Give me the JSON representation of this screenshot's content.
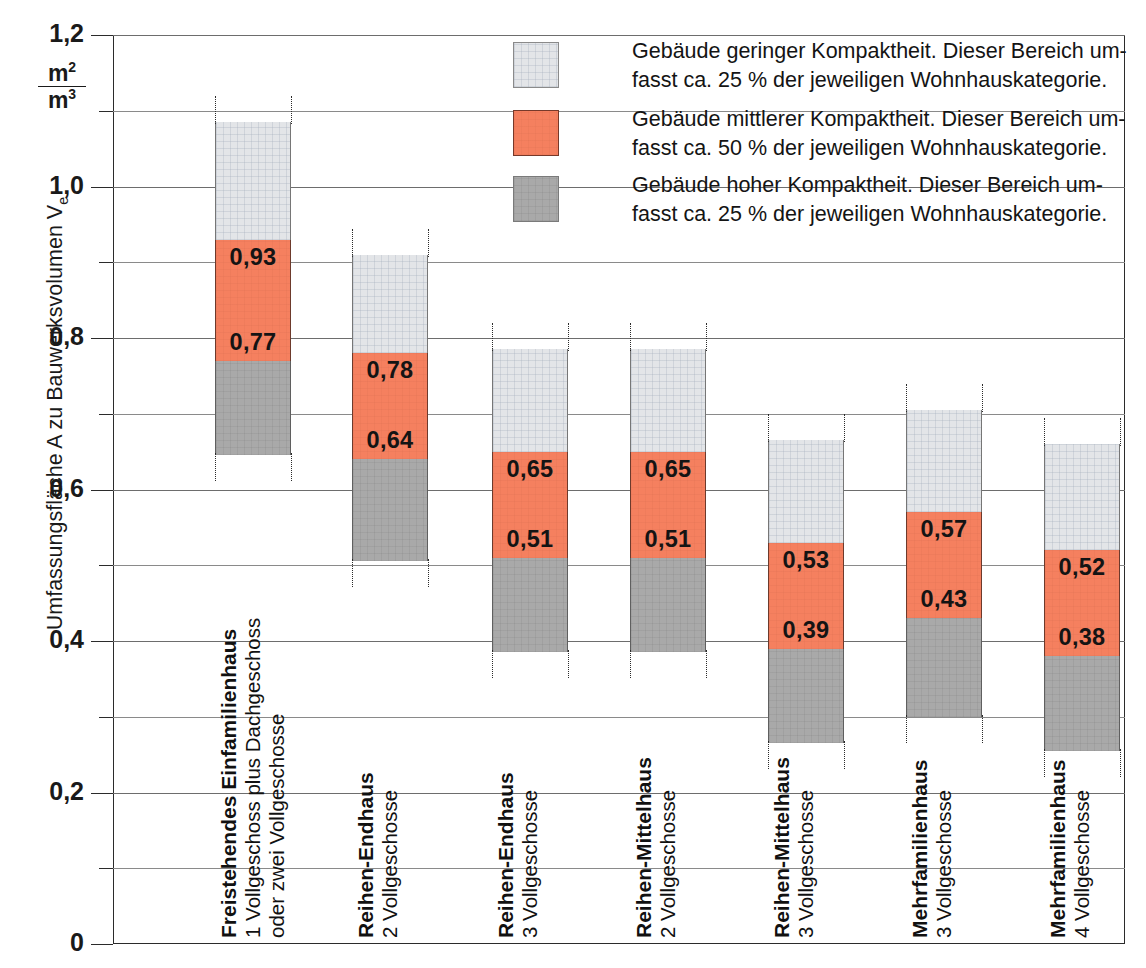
{
  "chart_data": {
    "type": "bar",
    "title": "",
    "xlabel": "",
    "ylabel": "Umfassungsfläche A zu Bauwerksvolumen V",
    "ylabel_sub": "e",
    "yunit_numerator": "m",
    "yunit_numerator_sup": "2",
    "yunit_denominator": "m",
    "yunit_denominator_sup": "3",
    "ylim": [
      0,
      1.2
    ],
    "grid": true,
    "legend_position": "top-right",
    "ytick_labels": [
      "1,2",
      "1,0",
      "0,8",
      "0,6",
      "0,4",
      "0,2",
      "0"
    ],
    "ytick_values": [
      1.2,
      1.0,
      0.8,
      0.6,
      0.4,
      0.2,
      0
    ],
    "yminor_values": [
      1.1,
      0.9,
      0.7,
      0.5,
      0.3,
      0.1
    ],
    "categories": [
      "Freistehendes Einfamilienhaus",
      "Reihen-Endhaus",
      "Reihen-Endhaus",
      "Reihen-Mittelhaus",
      "Reihen-Mittelhaus",
      "Mehrfamilienhaus",
      "Mehrfamilienhaus"
    ],
    "series": [
      {
        "name": "Gebäude hoher Kompaktheit",
        "key": "high",
        "color": "#a9a9a9"
      },
      {
        "name": "Gebäude mittlerer Kompaktheit",
        "key": "mid",
        "color": "#f5805f"
      },
      {
        "name": "Gebäude geringer Kompaktheit",
        "key": "low",
        "color": "#e3e5e8"
      }
    ],
    "bars": [
      {
        "id": "bar-1",
        "label_line1": "Freistehendes Einfamilienhaus",
        "label_line2": "1 Vollgeschoss plus Dachgeschoss",
        "label_line3": "oder zwei Vollgeschosse",
        "bottom": 0.645,
        "break_low": 0.77,
        "break_high": 0.93,
        "top": 1.085,
        "value_low_label": "0,77",
        "value_high_label": "0,93"
      },
      {
        "id": "bar-2",
        "label_line1": "Reihen-Endhaus",
        "label_line2": "2 Vollgeschosse",
        "label_line3": "",
        "bottom": 0.505,
        "break_low": 0.64,
        "break_high": 0.78,
        "top": 0.91,
        "value_low_label": "0,64",
        "value_high_label": "0,78"
      },
      {
        "id": "bar-3",
        "label_line1": "Reihen-Endhaus",
        "label_line2": "3 Vollgeschosse",
        "label_line3": "",
        "bottom": 0.385,
        "break_low": 0.51,
        "break_high": 0.65,
        "top": 0.785,
        "value_low_label": "0,51",
        "value_high_label": "0,65"
      },
      {
        "id": "bar-4",
        "label_line1": "Reihen-Mittelhaus",
        "label_line2": "2 Vollgeschosse",
        "label_line3": "",
        "bottom": 0.385,
        "break_low": 0.51,
        "break_high": 0.65,
        "top": 0.785,
        "value_low_label": "0,51",
        "value_high_label": "0,65"
      },
      {
        "id": "bar-5",
        "label_line1": "Reihen-Mittelhaus",
        "label_line2": "3 Vollgeschosse",
        "label_line3": "",
        "bottom": 0.265,
        "break_low": 0.39,
        "break_high": 0.53,
        "top": 0.665,
        "value_low_label": "0,39",
        "value_high_label": "0,53"
      },
      {
        "id": "bar-6",
        "label_line1": "Mehrfamilienhaus",
        "label_line2": "3 Vollgeschosse",
        "label_line3": "",
        "bottom": 0.3,
        "break_low": 0.43,
        "break_high": 0.57,
        "top": 0.705,
        "value_low_label": "0,43",
        "value_high_label": "0,57"
      },
      {
        "id": "bar-7",
        "label_line1": "Mehrfamilienhaus",
        "label_line2": "4 Vollgeschosse",
        "label_line3": "",
        "bottom": 0.255,
        "break_low": 0.38,
        "break_high": 0.52,
        "top": 0.66,
        "value_low_label": "0,38",
        "value_high_label": "0,52"
      }
    ]
  },
  "legend": {
    "items": [
      {
        "swatch": "low",
        "line1": "Gebäude geringer Kompaktheit. Dieser Bereich um-",
        "line2": "fasst ca. 25 % der jeweiligen Wohnhauskategorie."
      },
      {
        "swatch": "mid",
        "line1": "Gebäude mittlerer Kompaktheit. Dieser Bereich um-",
        "line2": "fasst ca. 50 % der jeweiligen Wohnhauskategorie."
      },
      {
        "swatch": "high",
        "line1": "Gebäude hoher Kompaktheit. Dieser Bereich um-",
        "line2": "fasst ca. 25 % der jeweiligen Wohnhauskategorie."
      }
    ]
  },
  "axis": {
    "y_title_main": "Umfassungsfläche A zu Bauwerksvolumen V",
    "y_title_sub": "e",
    "unit_top": "m",
    "unit_top_sup": "2",
    "unit_bottom": "m",
    "unit_bottom_sup": "3",
    "ticks": [
      {
        "label": "1,2",
        "value": 1.2
      },
      {
        "label": "1,0",
        "value": 1.0
      },
      {
        "label": "0,8",
        "value": 0.8
      },
      {
        "label": "0,6",
        "value": 0.6
      },
      {
        "label": "0,4",
        "value": 0.4
      },
      {
        "label": "0,2",
        "value": 0.2
      },
      {
        "label": "0",
        "value": 0.0
      }
    ]
  },
  "colors": {
    "low": "#e3e5e8",
    "mid": "#f5805f",
    "high": "#a9a9a9",
    "frame": "#2b2b2b",
    "grid": "#6d6d6d"
  }
}
